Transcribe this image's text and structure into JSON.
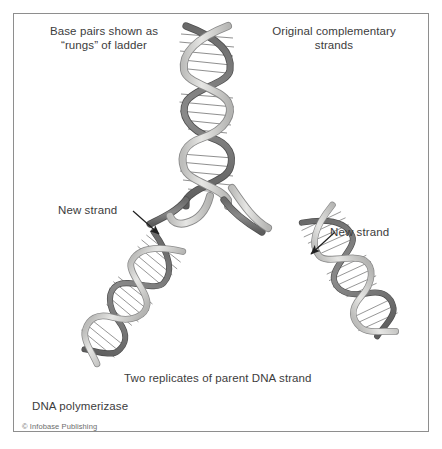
{
  "figure": {
    "background_color": "#ffffff",
    "frame_color": "#8e8e8e"
  },
  "labels": {
    "base_pairs": "Base pairs shown as\n“rungs” of ladder",
    "original_strands": "Original complementary\nstrands",
    "new_strand_left": "New strand",
    "new_strand_right": "New strand",
    "two_replicates": "Two replicates of parent DNA strand",
    "dna_polymerizase": "DNA polymerizase",
    "copyright": "© Infobase Publishing"
  },
  "colors": {
    "ribbon_dark": "#6e6e6e",
    "ribbon_dark_edge": "#4a4a4a",
    "ribbon_light": "#d8d8d6",
    "ribbon_light_edge": "#8c8c8c",
    "rung": "#7a7a7a",
    "text": "#3c3c3c",
    "copyright_text": "#6d6d6d",
    "arrow": "#1f1f1f"
  },
  "diagram_elements": [
    {
      "name": "parent-helix",
      "description": "Original complementary double helix at top center, vertical axis",
      "turns": 3
    },
    {
      "name": "replication-fork",
      "description": "Point near center where the parent helix separates into two daughter helices"
    },
    {
      "name": "daughter-helix-left",
      "description": "Left replicate double helix running down and to the left",
      "turns": 3
    },
    {
      "name": "daughter-helix-right",
      "description": "Right replicate double helix running down and to the right",
      "turns": 3
    },
    {
      "name": "arrow-new-strand-left",
      "description": "Leader line with arrowhead pointing down-right to the left daughter helix"
    },
    {
      "name": "arrow-new-strand-right",
      "description": "Leader line with arrowhead pointing down-left to the right daughter helix"
    }
  ]
}
